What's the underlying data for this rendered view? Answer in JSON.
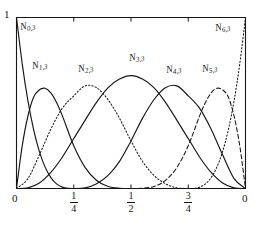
{
  "figure": {
    "kind": "cubic-b-spline-basis-plot",
    "background": "#ffffff",
    "ink_color": "#161616"
  },
  "axes": {
    "y_top_label": "1",
    "x_left_label": "0",
    "x_right_label": "0",
    "ticks": [
      {
        "value": 0.25,
        "numerator": "1",
        "denominator": "4"
      },
      {
        "value": 0.5,
        "numerator": "1",
        "denominator": "2"
      },
      {
        "value": 0.75,
        "numerator": "3",
        "denominator": "4"
      }
    ]
  },
  "labels": {
    "n0": {
      "base": "N",
      "sub": "0,3"
    },
    "n1": {
      "base": "N",
      "sub": "1,3"
    },
    "n2": {
      "base": "N",
      "sub": "2,3"
    },
    "n3": {
      "base": "N",
      "sub": "3,3"
    },
    "n4": {
      "base": "N",
      "sub": "4,3"
    },
    "n5": {
      "base": "N",
      "sub": "5,3"
    },
    "n6": {
      "base": "N",
      "sub": "6,3"
    }
  },
  "chart_data": {
    "type": "line",
    "title": "",
    "xlabel": "",
    "ylabel": "",
    "xlim": [
      0,
      1
    ],
    "ylim": [
      0,
      1
    ],
    "grid": false,
    "legend": "inline-curve-labels",
    "x_tick_values": [
      0,
      0.25,
      0.5,
      0.75,
      1
    ],
    "x_tick_labels": [
      "0",
      "1/4",
      "1/2",
      "3/4",
      "0"
    ],
    "y_tick_values": [
      1
    ],
    "y_tick_labels": [
      "1"
    ],
    "degree": 3,
    "knot_vector": [
      0,
      0,
      0,
      0,
      0.25,
      0.5,
      0.75,
      1,
      1,
      1,
      1
    ],
    "series": [
      {
        "name": "N_0,3",
        "label": "N0,3",
        "linestyle": "solid",
        "peak_x": 0.0,
        "peak_y": 1.0,
        "support": [
          0,
          0.25
        ],
        "points": [
          [
            0.0,
            1.0
          ],
          [
            0.025,
            0.729
          ],
          [
            0.05,
            0.512
          ],
          [
            0.075,
            0.343
          ],
          [
            0.1,
            0.216
          ],
          [
            0.125,
            0.125
          ],
          [
            0.15,
            0.064
          ],
          [
            0.175,
            0.027
          ],
          [
            0.2,
            0.008
          ],
          [
            0.225,
            0.001
          ],
          [
            0.25,
            0.0
          ]
        ]
      },
      {
        "name": "N_1,3",
        "label": "N1,3",
        "linestyle": "solid",
        "peak_x": 0.125,
        "peak_y": 0.586,
        "support": [
          0,
          0.5
        ],
        "points": [
          [
            0.0,
            0.0
          ],
          [
            0.025,
            0.249
          ],
          [
            0.05,
            0.424
          ],
          [
            0.075,
            0.535
          ],
          [
            0.1,
            0.577
          ],
          [
            0.125,
            0.586
          ],
          [
            0.15,
            0.559
          ],
          [
            0.175,
            0.503
          ],
          [
            0.2,
            0.426
          ],
          [
            0.25,
            0.25
          ],
          [
            0.3,
            0.122
          ],
          [
            0.35,
            0.047
          ],
          [
            0.4,
            0.012
          ],
          [
            0.45,
            0.0015
          ],
          [
            0.5,
            0.0
          ]
        ]
      },
      {
        "name": "N_2,3",
        "label": "N2,3",
        "linestyle": "dotted",
        "peak_x": 0.3,
        "peak_y": 0.6,
        "support": [
          0,
          0.75
        ],
        "points": [
          [
            0.0,
            0.0
          ],
          [
            0.05,
            0.058
          ],
          [
            0.1,
            0.197
          ],
          [
            0.15,
            0.347
          ],
          [
            0.2,
            0.469
          ],
          [
            0.25,
            0.542
          ],
          [
            0.3,
            0.6
          ],
          [
            0.35,
            0.589
          ],
          [
            0.4,
            0.519
          ],
          [
            0.45,
            0.41
          ],
          [
            0.5,
            0.278
          ],
          [
            0.55,
            0.159
          ],
          [
            0.6,
            0.077
          ],
          [
            0.65,
            0.028
          ],
          [
            0.7,
            0.004
          ],
          [
            0.75,
            0.0
          ]
        ]
      },
      {
        "name": "N_3,3",
        "label": "N3,3",
        "linestyle": "solid",
        "peak_x": 0.5,
        "peak_y": 0.66,
        "support": [
          0,
          1
        ],
        "points": [
          [
            0.0,
            0.0
          ],
          [
            0.05,
            0.004
          ],
          [
            0.1,
            0.032
          ],
          [
            0.15,
            0.094
          ],
          [
            0.2,
            0.183
          ],
          [
            0.25,
            0.292
          ],
          [
            0.3,
            0.4
          ],
          [
            0.35,
            0.505
          ],
          [
            0.4,
            0.59
          ],
          [
            0.45,
            0.64
          ],
          [
            0.5,
            0.66
          ],
          [
            0.55,
            0.64
          ],
          [
            0.6,
            0.59
          ],
          [
            0.65,
            0.505
          ],
          [
            0.7,
            0.4
          ],
          [
            0.75,
            0.292
          ],
          [
            0.8,
            0.183
          ],
          [
            0.85,
            0.094
          ],
          [
            0.9,
            0.032
          ],
          [
            0.95,
            0.004
          ],
          [
            1.0,
            0.0
          ]
        ]
      },
      {
        "name": "N_4,3",
        "label": "N4,3",
        "linestyle": "solid",
        "peak_x": 0.7,
        "peak_y": 0.6,
        "support": [
          0.25,
          1
        ],
        "points": [
          [
            0.25,
            0.0
          ],
          [
            0.3,
            0.004
          ],
          [
            0.35,
            0.028
          ],
          [
            0.4,
            0.077
          ],
          [
            0.45,
            0.159
          ],
          [
            0.5,
            0.278
          ],
          [
            0.55,
            0.41
          ],
          [
            0.6,
            0.519
          ],
          [
            0.65,
            0.589
          ],
          [
            0.7,
            0.6
          ],
          [
            0.75,
            0.542
          ],
          [
            0.8,
            0.469
          ],
          [
            0.85,
            0.347
          ],
          [
            0.9,
            0.197
          ],
          [
            0.95,
            0.058
          ],
          [
            1.0,
            0.0
          ]
        ]
      },
      {
        "name": "N_5,3",
        "label": "N5,3",
        "linestyle": "dashed",
        "peak_x": 0.875,
        "peak_y": 0.586,
        "support": [
          0.5,
          1
        ],
        "points": [
          [
            0.5,
            0.0
          ],
          [
            0.55,
            0.0015
          ],
          [
            0.6,
            0.012
          ],
          [
            0.65,
            0.047
          ],
          [
            0.7,
            0.122
          ],
          [
            0.75,
            0.25
          ],
          [
            0.8,
            0.426
          ],
          [
            0.825,
            0.503
          ],
          [
            0.85,
            0.559
          ],
          [
            0.875,
            0.586
          ],
          [
            0.9,
            0.577
          ],
          [
            0.925,
            0.535
          ],
          [
            0.95,
            0.424
          ],
          [
            0.975,
            0.249
          ],
          [
            1.0,
            0.0
          ]
        ]
      },
      {
        "name": "N_6,3",
        "label": "N6,3",
        "linestyle": "dotted",
        "peak_x": 1.0,
        "peak_y": 1.0,
        "support": [
          0.75,
          1
        ],
        "points": [
          [
            0.75,
            0.0
          ],
          [
            0.775,
            0.001
          ],
          [
            0.8,
            0.008
          ],
          [
            0.825,
            0.027
          ],
          [
            0.85,
            0.064
          ],
          [
            0.875,
            0.125
          ],
          [
            0.9,
            0.216
          ],
          [
            0.925,
            0.343
          ],
          [
            0.95,
            0.512
          ],
          [
            0.975,
            0.729
          ],
          [
            1.0,
            1.0
          ]
        ]
      }
    ]
  }
}
